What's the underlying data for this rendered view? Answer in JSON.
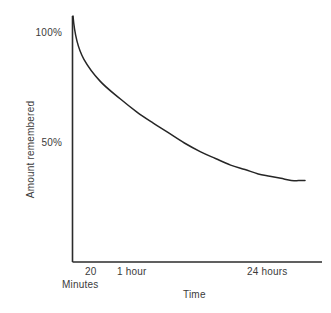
{
  "chart_data": {
    "type": "line",
    "title": "",
    "xlabel": "Time",
    "ylabel": "Amount remembered",
    "grid": false,
    "legend": "none",
    "x_tick_labels": [
      "20",
      "1 hour",
      "24 hours"
    ],
    "x_tick_sublabel": "Minutes",
    "y_tick_labels": [
      "100%",
      "50%"
    ],
    "y_tick_values": [
      100,
      50
    ],
    "ylim": [
      0,
      108
    ],
    "xlim": [
      0,
      24
    ],
    "x_units": "hours",
    "series": [
      {
        "name": "Retention",
        "x": [
          0,
          0.05,
          0.15,
          0.33,
          0.55,
          0.85,
          1.2,
          1.8,
          2.6,
          3.6,
          5.0,
          6.8,
          9.0,
          11.5,
          14.5,
          18.0,
          21.0,
          23.5
        ],
        "values": [
          100,
          88,
          78,
          70,
          64,
          59,
          55,
          50,
          46,
          43,
          40,
          38,
          36,
          35,
          34,
          33,
          33,
          33
        ]
      }
    ],
    "line_color": "#262626",
    "axis_color": "#2b2b2b",
    "text_color": "#3b3b3b",
    "background_color": "#ffffff"
  },
  "axes": {
    "y_tick_100": "100%",
    "y_tick_50": "50%",
    "y_title": "Amount remembered",
    "x_tick_20": "20",
    "x_tick_minutes": "Minutes",
    "x_tick_1hour": "1 hour",
    "x_tick_24hours": "24 hours",
    "x_title": "Time"
  }
}
